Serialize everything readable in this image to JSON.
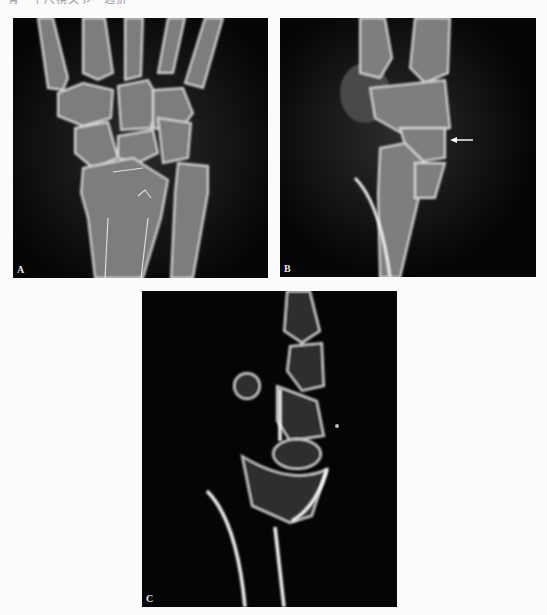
{
  "figure": {
    "top_caption_fragment": "骨 · 下尺桡关节 · 远折 ·",
    "panels": [
      {
        "id": "A",
        "label": "A",
        "description": "Posteroanterior wrist radiograph"
      },
      {
        "id": "B",
        "label": "B",
        "description": "Lateral wrist radiograph",
        "annotation": "arrow-pointing-left"
      },
      {
        "id": "C",
        "label": "C",
        "description": "Sagittal CT reconstruction of wrist"
      }
    ],
    "colors": {
      "background": "#fbfbfb",
      "panel": "#050505",
      "bone": "#bdbdbd",
      "cortex": "#efefef"
    }
  }
}
